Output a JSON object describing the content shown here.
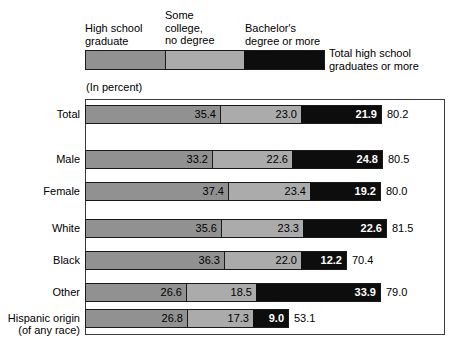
{
  "legend": {
    "categories": [
      "High school\ngraduate",
      "Some\ncollege,\nno degree",
      "Bachelor's\ndegree or more"
    ],
    "total_caption": "Total high school\ngraduates or more",
    "units_note": "(In percent)"
  },
  "colors": {
    "segment_high_school": "#919191",
    "segment_some_college": "#ababab",
    "segment_bachelors": "#0d0d0d",
    "frame": "#3a3a3a",
    "background": "#ffffff",
    "text": "#000000",
    "value_text_on_dark": "#ffffff"
  },
  "chart_data": {
    "type": "bar",
    "subtype": "stacked-horizontal",
    "title": "",
    "subtitle": "",
    "xlabel": "",
    "ylabel": "",
    "units": "(In percent)",
    "xlim": [
      0,
      100
    ],
    "grid": false,
    "legend_position": "top",
    "categories": [
      "Total",
      "Male",
      "Female",
      "White",
      "Black",
      "Other",
      "Hispanic origin\n(of any race)"
    ],
    "series": [
      {
        "name": "High school graduate",
        "color": "#919191",
        "values": [
          35.4,
          33.2,
          37.4,
          35.6,
          36.3,
          26.6,
          26.8
        ]
      },
      {
        "name": "Some college, no degree",
        "color": "#ababab",
        "values": [
          23.0,
          22.6,
          23.4,
          23.3,
          22.0,
          18.5,
          17.3
        ]
      },
      {
        "name": "Bachelor's degree or more",
        "color": "#0d0d0d",
        "values": [
          21.9,
          24.8,
          19.2,
          22.6,
          12.2,
          33.9,
          9.0
        ]
      }
    ],
    "totals": {
      "name": "Total high school graduates or more",
      "values": [
        80.2,
        80.5,
        80.0,
        81.5,
        70.4,
        79.0,
        53.1
      ]
    }
  },
  "rows": [
    {
      "label": "Total",
      "seg1": "35.4",
      "seg2": "23.0",
      "seg3": "21.9",
      "total": "80.2",
      "w1": 135,
      "w2": 80,
      "w3": 80
    },
    {
      "label": "Male",
      "seg1": "33.2",
      "seg2": "22.6",
      "seg3": "24.8",
      "total": "80.5",
      "w1": 127,
      "w2": 79,
      "w3": 90
    },
    {
      "label": "Female",
      "seg1": "37.4",
      "seg2": "23.4",
      "seg3": "19.2",
      "total": "80.0",
      "w1": 143,
      "w2": 81,
      "w3": 70
    },
    {
      "label": "White",
      "seg1": "35.6",
      "seg2": "23.3",
      "seg3": "22.6",
      "total": "81.5",
      "w1": 136,
      "w2": 81,
      "w3": 83
    },
    {
      "label": "Black",
      "seg1": "36.3",
      "seg2": "22.0",
      "seg3": "12.2",
      "total": "70.4",
      "w1": 139,
      "w2": 76,
      "w3": 45
    },
    {
      "label": "Other",
      "seg1": "26.6",
      "seg2": "18.5",
      "seg3": "33.9",
      "total": "79.0",
      "w1": 101,
      "w2": 69,
      "w3": 124
    },
    {
      "label": "Hispanic origin\n(of any race)",
      "seg1": "26.8",
      "seg2": "17.3",
      "seg3": "9.0",
      "total": "53.1",
      "w1": 102,
      "w2": 65,
      "w3": 35
    }
  ],
  "row_tops": [
    105,
    150,
    182,
    219,
    251,
    283,
    309
  ]
}
